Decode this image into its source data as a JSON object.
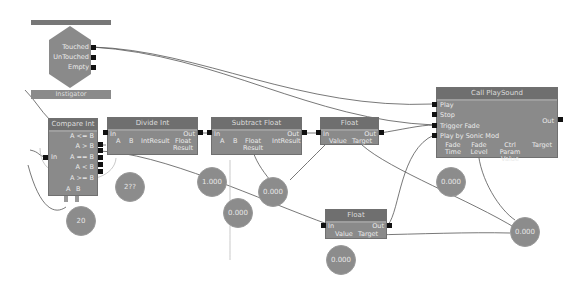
{
  "top_bar": {
    "label": "Event Touch Collision"
  },
  "hexagon_event": {
    "outputs": [
      "Touched",
      "UnTouched",
      "Empty"
    ]
  },
  "instigator_bar": {
    "label": "Instigator"
  },
  "compare_int": {
    "title": "Compare Int",
    "input": "In",
    "outputs": [
      "A <= B",
      "A > B",
      "A == B",
      "A < B",
      "A >= B"
    ],
    "vars": [
      "A",
      "B"
    ]
  },
  "divide_int": {
    "title": "Divide Int",
    "input": "In",
    "output": "Out",
    "vars": [
      "A",
      "B",
      "IntResult",
      "Float Result"
    ]
  },
  "subtract_float": {
    "title": "Subtract Float",
    "input": "In",
    "output": "Out",
    "vars": [
      "A",
      "B",
      "Float Result",
      "IntResult"
    ]
  },
  "float_top": {
    "title": "Float",
    "input": "In",
    "output": "Out",
    "vars": [
      "Value",
      "Target"
    ]
  },
  "float_bottom": {
    "title": "Float",
    "input": "In",
    "output": "Out",
    "vars": [
      "Value",
      "Target"
    ]
  },
  "play_sound": {
    "title": "Call PlaySound",
    "inputs": [
      "Play",
      "Stop",
      "Trigger Fade",
      "Play by Sonic Mod"
    ],
    "output": "Out",
    "vars": [
      "Fade Time",
      "Fade Level",
      "Ctrl Param Value",
      "Target"
    ]
  },
  "variables": {
    "compare_b": "20",
    "divide_b": "2??",
    "sub_a": "1.000",
    "sub_mid": "0.000",
    "sub_result": "0.000",
    "float_bottom_value": "0.000",
    "fade_time": "0.000",
    "shared_float": "0.000"
  }
}
